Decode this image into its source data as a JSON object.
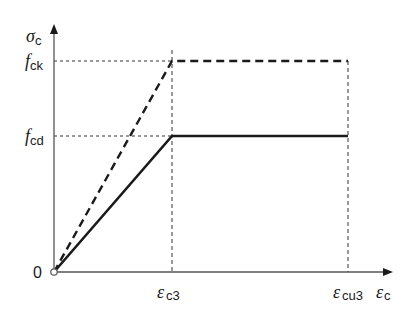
{
  "diagram": {
    "y_axis": {
      "symbol": "σ",
      "subscript": "c"
    },
    "x_axis": {
      "symbol": "ε",
      "subscript": "c"
    },
    "origin_label": "0",
    "y_ticks": [
      {
        "symbol": "f",
        "subscript": "ck"
      },
      {
        "symbol": "f",
        "subscript": "cd"
      }
    ],
    "x_ticks": [
      {
        "symbol": "ε",
        "subscript": "c3"
      },
      {
        "symbol": "ε",
        "subscript": "cu3"
      }
    ],
    "curves": [
      {
        "name": "characteristic",
        "style": "dashed",
        "points": [
          [
            0,
            0
          ],
          [
            "εc3",
            "fck"
          ],
          [
            "εcu3",
            "fck"
          ]
        ]
      },
      {
        "name": "design",
        "style": "solid",
        "points": [
          [
            0,
            0
          ],
          [
            "εc3",
            "fcd"
          ],
          [
            "εcu3",
            "fcd"
          ]
        ]
      }
    ],
    "colors": {
      "line": "#1a1a1a",
      "axis": "#555555",
      "guide": "#333333"
    }
  }
}
